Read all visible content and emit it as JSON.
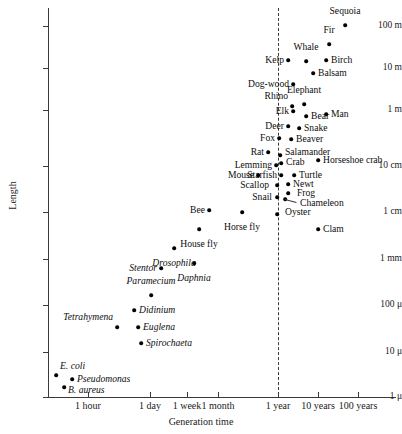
{
  "chart_data": {
    "type": "scatter",
    "title": "",
    "xlabel": "Generation time",
    "ylabel": "Length",
    "grid": false,
    "legend": null,
    "x_scale": "log",
    "y_scale": "log",
    "x_tick_labels": [
      "1 hour",
      "1 day",
      "1 week",
      "1 month",
      "1 year",
      "10 years",
      "100 years"
    ],
    "y_tick_labels": [
      "100 m",
      "10 m",
      "1 m",
      "10 cm",
      "1 cm",
      "1 mm",
      "100 μ",
      "10 μ",
      "1 μ"
    ],
    "annotations": [
      {
        "name": "one-year-reference-line",
        "label": "",
        "x_tick": "1 year",
        "style": "dashed-vertical"
      }
    ],
    "points": [
      {
        "label": "Sequoia",
        "x": 345,
        "y": 25,
        "lx": 345,
        "ly": 16,
        "pos": "above",
        "italic": false
      },
      {
        "label": "Fir",
        "x": 329,
        "y": 44,
        "lx": 329,
        "ly": 35,
        "pos": "above",
        "italic": false
      },
      {
        "label": "Birch",
        "x": 326,
        "y": 60,
        "lx": 331,
        "ly": 60,
        "pos": "right",
        "italic": false
      },
      {
        "label": "Whale",
        "x": 306,
        "y": 61,
        "lx": 306,
        "ly": 52,
        "pos": "above",
        "italic": false
      },
      {
        "label": "Balsam",
        "x": 313,
        "y": 73,
        "lx": 318,
        "ly": 73,
        "pos": "right",
        "italic": false
      },
      {
        "label": "Kelp",
        "x": 288,
        "y": 60,
        "lx": 284,
        "ly": 60,
        "pos": "left",
        "italic": false
      },
      {
        "label": "Dog-wood",
        "x": 293,
        "y": 84,
        "lx": 289,
        "ly": 84,
        "pos": "left",
        "italic": false
      },
      {
        "label": "Elephant",
        "x": 304,
        "y": 104,
        "lx": 304,
        "ly": 95,
        "pos": "above",
        "italic": false
      },
      {
        "label": "Rhino",
        "x": 292,
        "y": 106,
        "lx": 288,
        "ly": 96,
        "pos": "left",
        "italic": false
      },
      {
        "label": "Man",
        "x": 326,
        "y": 114,
        "lx": 331,
        "ly": 114,
        "pos": "right",
        "italic": false
      },
      {
        "label": "Bear",
        "x": 306,
        "y": 116,
        "lx": 311,
        "ly": 116,
        "pos": "right",
        "italic": false
      },
      {
        "label": "Elk",
        "x": 293,
        "y": 111,
        "lx": 289,
        "ly": 111,
        "pos": "left",
        "italic": false
      },
      {
        "label": "Snake",
        "x": 299,
        "y": 128,
        "lx": 304,
        "ly": 128,
        "pos": "right",
        "italic": false
      },
      {
        "label": "Deer",
        "x": 288,
        "y": 126,
        "lx": 284,
        "ly": 126,
        "pos": "left",
        "italic": false
      },
      {
        "label": "Beaver",
        "x": 291,
        "y": 139,
        "lx": 296,
        "ly": 139,
        "pos": "right",
        "italic": false
      },
      {
        "label": "Fox",
        "x": 279,
        "y": 138,
        "lx": 275,
        "ly": 138,
        "pos": "left",
        "italic": false
      },
      {
        "label": "Salamander",
        "x": 280,
        "y": 155,
        "lx": 285,
        "ly": 152,
        "pos": "right",
        "italic": false
      },
      {
        "label": "Rat",
        "x": 268,
        "y": 152,
        "lx": 264,
        "ly": 152,
        "pos": "left",
        "italic": false
      },
      {
        "label": "Horseshoe crab",
        "x": 318,
        "y": 160,
        "lx": 323,
        "ly": 160,
        "pos": "right",
        "italic": false
      },
      {
        "label": "Crab",
        "x": 281,
        "y": 163,
        "lx": 286,
        "ly": 162,
        "pos": "right",
        "italic": false
      },
      {
        "label": "Lemming",
        "x": 276,
        "y": 165,
        "lx": 272,
        "ly": 165,
        "pos": "left",
        "italic": false
      },
      {
        "label": "Turtle",
        "x": 294,
        "y": 175,
        "lx": 299,
        "ly": 175,
        "pos": "right",
        "italic": false
      },
      {
        "label": "Starfish",
        "x": 281,
        "y": 175,
        "lx": 277,
        "ly": 175,
        "pos": "left",
        "italic": false
      },
      {
        "label": "Mouse",
        "x": 258,
        "y": 175,
        "lx": 254,
        "ly": 175,
        "pos": "left",
        "italic": false
      },
      {
        "label": "Newt",
        "x": 288,
        "y": 184,
        "lx": 293,
        "ly": 184,
        "pos": "right",
        "italic": false
      },
      {
        "label": "Scallop",
        "x": 277,
        "y": 185,
        "lx": 269,
        "ly": 185,
        "pos": "left",
        "italic": false
      },
      {
        "label": "Frog",
        "x": 288,
        "y": 193,
        "lx": 297,
        "ly": 193,
        "pos": "right",
        "italic": false
      },
      {
        "label": "Snail",
        "x": 277,
        "y": 197,
        "lx": 272,
        "ly": 197,
        "pos": "left",
        "italic": false
      },
      {
        "label": "Chameleon",
        "x": 285,
        "y": 199,
        "lx": 300,
        "ly": 203,
        "pos": "right",
        "italic": false
      },
      {
        "label": "Oyster",
        "x": 277,
        "y": 214,
        "lx": 285,
        "ly": 212,
        "pos": "right",
        "italic": false
      },
      {
        "label": "Bee",
        "x": 209,
        "y": 210,
        "lx": 205,
        "ly": 210,
        "pos": "left",
        "italic": false
      },
      {
        "label": "Horse fly",
        "x": 242,
        "y": 212,
        "lx": 242,
        "ly": 222,
        "pos": "below",
        "italic": false
      },
      {
        "label": "Clam",
        "x": 318,
        "y": 229,
        "lx": 323,
        "ly": 229,
        "pos": "right",
        "italic": false
      },
      {
        "label": "House fly",
        "x": 199,
        "y": 229,
        "lx": 199,
        "ly": 239,
        "pos": "below",
        "italic": false
      },
      {
        "label": "Drosophila",
        "x": 174,
        "y": 248,
        "lx": 174,
        "ly": 258,
        "pos": "below",
        "italic": true
      },
      {
        "label": "Daphnia",
        "x": 194,
        "y": 263,
        "lx": 194,
        "ly": 273,
        "pos": "below",
        "italic": true
      },
      {
        "label": "Stentor",
        "x": 161,
        "y": 268,
        "lx": 157,
        "ly": 268,
        "pos": "left",
        "italic": true
      },
      {
        "label": "Paramecium",
        "x": 151,
        "y": 295,
        "lx": 151,
        "ly": 286,
        "pos": "above",
        "italic": true
      },
      {
        "label": "Didinium",
        "x": 134,
        "y": 310,
        "lx": 139,
        "ly": 310,
        "pos": "right",
        "italic": true
      },
      {
        "label": "Euglena",
        "x": 138,
        "y": 327,
        "lx": 143,
        "ly": 327,
        "pos": "right",
        "italic": true
      },
      {
        "label": "Tetrahymena",
        "x": 117,
        "y": 327,
        "lx": 113,
        "ly": 317,
        "pos": "left",
        "italic": true
      },
      {
        "label": "Spirochaeta",
        "x": 141,
        "y": 343,
        "lx": 146,
        "ly": 343,
        "pos": "right",
        "italic": true
      },
      {
        "label": "E. coli",
        "x": 56,
        "y": 375,
        "lx": 60,
        "ly": 366,
        "pos": "right",
        "italic": true
      },
      {
        "label": "Pseudomonas",
        "x": 72,
        "y": 379,
        "lx": 77,
        "ly": 379,
        "pos": "right",
        "italic": true
      },
      {
        "label": "B. aureus",
        "x": 64,
        "y": 387,
        "lx": 68,
        "ly": 390,
        "pos": "below-right",
        "italic": true
      }
    ]
  },
  "axes": {
    "y_ticks": [
      {
        "label": "100 m",
        "px": 26
      },
      {
        "label": "10 m",
        "px": 68
      },
      {
        "label": "1 m",
        "px": 110
      },
      {
        "label": "10 cm",
        "px": 166
      },
      {
        "label": "1 cm",
        "px": 212
      },
      {
        "label": "1 mm",
        "px": 259
      },
      {
        "label": "100 μ",
        "px": 305
      },
      {
        "label": "10 μ",
        "px": 352
      },
      {
        "label": "1 μ",
        "px": 397
      }
    ],
    "x_ticks": [
      {
        "label": "1 hour",
        "px": 88
      },
      {
        "label": "1 day",
        "px": 150
      },
      {
        "label": "1 week",
        "px": 187
      },
      {
        "label": "1 month",
        "px": 218
      },
      {
        "label": "1 year",
        "px": 278
      },
      {
        "label": "10 years",
        "px": 318
      },
      {
        "label": "100 years",
        "px": 358
      }
    ],
    "y_title": "Length",
    "x_title": "Generation time",
    "reference_line_px": 278
  }
}
